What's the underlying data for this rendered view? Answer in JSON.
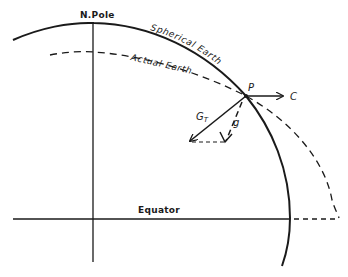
{
  "diagram": {
    "title": "",
    "labels": {
      "north_pole": "N.Pole",
      "spherical_earth": "Spherical Earth",
      "actual_earth": "Actual Earth",
      "point": "P",
      "centrifugal": "C",
      "gravitation": "G",
      "gravitation_subscript": "T",
      "gravity": "g",
      "equator": "Equator"
    },
    "colors": {
      "ink": "#1a1a1a",
      "background": "#ffffff"
    },
    "elements": [
      {
        "id": "spherical-earth-arc",
        "style": "solid",
        "desc": "Circular arc from upper left over N.Pole down through P to below Equator"
      },
      {
        "id": "actual-earth-arc",
        "style": "dashed",
        "desc": "Flattened ellipse arc, inside sphere at pole, outside sphere at equator"
      },
      {
        "id": "polar-axis",
        "style": "solid",
        "desc": "Vertical line through N.Pole"
      },
      {
        "id": "equator-line",
        "style": "solid",
        "desc": "Horizontal equatorial line"
      },
      {
        "id": "vector-C",
        "style": "solid-arrow",
        "desc": "Horizontal arrow from P pointing outward (centrifugal)"
      },
      {
        "id": "vector-GT",
        "style": "solid-arrow",
        "desc": "Arrow from P toward Earth center (true gravitation)"
      },
      {
        "id": "vector-g",
        "style": "dashed-arrow",
        "desc": "Dashed arrow from P (effective gravity, normal to actual surface)"
      },
      {
        "id": "parallelogram-closure",
        "style": "dashed",
        "desc": "Horizontal dashed segment joining G_T tip and g tip"
      },
      {
        "id": "equator-extension",
        "style": "dashed",
        "desc": "Dashed equator extension between sphere and ellipsoid"
      }
    ]
  }
}
